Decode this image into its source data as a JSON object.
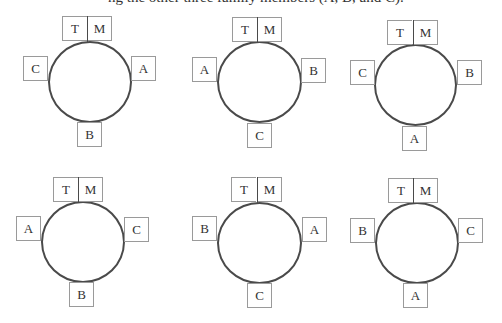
{
  "caption": "ng the other three family members (A, B, and C).",
  "diagrams": [
    {
      "label": "arrangement-1",
      "top_left": "T",
      "top_right": "M",
      "left": "C",
      "right": "A",
      "bottom": "B"
    },
    {
      "label": "arrangement-2",
      "top_left": "T",
      "top_right": "M",
      "left": "A",
      "right": "B",
      "bottom": "C"
    },
    {
      "label": "arrangement-3",
      "top_left": "T",
      "top_right": "M",
      "left": "C",
      "right": "B",
      "bottom": "A"
    },
    {
      "label": "arrangement-4",
      "top_left": "T",
      "top_right": "M",
      "left": "A",
      "right": "C",
      "bottom": "B"
    },
    {
      "label": "arrangement-5",
      "top_left": "T",
      "top_right": "M",
      "left": "B",
      "right": "A",
      "bottom": "C"
    },
    {
      "label": "arrangement-6",
      "top_left": "T",
      "top_right": "M",
      "left": "B",
      "right": "C",
      "bottom": "A"
    }
  ],
  "colors": {
    "circle_stroke": "#4a4a4a",
    "box_border": "#9a9a9a",
    "text": "#333333"
  }
}
